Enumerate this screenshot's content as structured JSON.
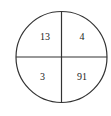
{
  "diagram": {
    "shape": "circle divided into four quadrants",
    "line_color": "#333333",
    "text_color": "#222222",
    "quadrants": {
      "top_left": "13",
      "top_right": "4",
      "bottom_left": "3",
      "bottom_right": "91"
    }
  }
}
